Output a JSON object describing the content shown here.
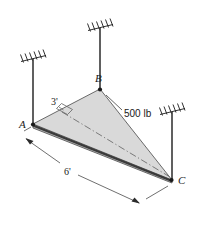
{
  "figure": {
    "background_color": "#ffffff",
    "plate": {
      "fill_color": "#d9d9d9",
      "edge_color": "#5a5a5a",
      "thick_edge_color": "#3a3a3a"
    },
    "vertices": [
      {
        "id": "A",
        "label": "A",
        "x": 33,
        "y": 124
      },
      {
        "id": "B",
        "label": "B",
        "x": 100,
        "y": 89
      },
      {
        "id": "C",
        "label": "C",
        "x": 172,
        "y": 180
      }
    ],
    "supports": [
      {
        "id": "support-a",
        "label": "A",
        "hatch_x": 22,
        "hatch_y": 57,
        "cable_top_y": 59,
        "cable_bottom_y": 124,
        "cable_x": 33
      },
      {
        "id": "support-b",
        "label": "B",
        "hatch_x": 89,
        "hatch_y": 26,
        "cable_top_y": 28,
        "cable_bottom_y": 89,
        "cable_x": 100
      },
      {
        "id": "support-c",
        "label": "C",
        "hatch_x": 161,
        "hatch_y": 110,
        "cable_top_y": 112,
        "cable_bottom_y": 180,
        "cable_x": 172
      }
    ],
    "dimensions": [
      {
        "id": "dim-3ft",
        "label": "3'",
        "label_x": 55,
        "label_y": 105,
        "value": 3,
        "unit": "ft"
      },
      {
        "id": "dim-6ft",
        "label": "6'",
        "label_x": 68,
        "label_y": 172,
        "value": 6,
        "unit": "ft"
      }
    ],
    "load": {
      "id": "load-500lb",
      "label": "500 lb",
      "value": 500,
      "unit": "lb",
      "label_x": 124,
      "label_y": 116
    },
    "annotations": {
      "right_angle_marker": "square",
      "centerline_style": "dash-dot",
      "hatch_style": "slanted-ceiling-hatch"
    }
  }
}
